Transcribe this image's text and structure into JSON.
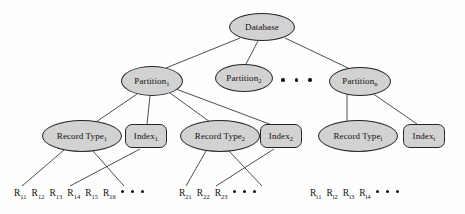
{
  "diagram": {
    "style": {
      "node_fill": "#d2d2d2",
      "node_stroke": "#262626",
      "edge_color": "#3a3a3a",
      "text_color": "#111111",
      "background": "#fefefe"
    },
    "nodes": [
      {
        "id": "database",
        "label": "Database",
        "sub": "",
        "shape": "ellipse",
        "level": 0,
        "cx": 262,
        "cy": 27,
        "w": 66,
        "h": 28
      },
      {
        "id": "partition1",
        "label": "Partition",
        "sub": "1",
        "shape": "ellipse",
        "level": 1,
        "cx": 152,
        "cy": 81,
        "w": 62,
        "h": 30
      },
      {
        "id": "partition2",
        "label": "Partition",
        "sub": "2",
        "shape": "ellipse",
        "level": 1,
        "cx": 244,
        "cy": 78,
        "w": 58,
        "h": 28
      },
      {
        "id": "partitionN",
        "label": "Partition",
        "sub": "n",
        "shape": "ellipse",
        "level": 1,
        "cx": 360,
        "cy": 81,
        "w": 62,
        "h": 29
      },
      {
        "id": "recordtype1",
        "label": "Record Type",
        "sub": "1",
        "shape": "ellipse",
        "level": 2,
        "cx": 82,
        "cy": 136,
        "w": 80,
        "h": 32
      },
      {
        "id": "index1",
        "label": "Index",
        "sub": "1",
        "shape": "roundrect",
        "level": 2,
        "cx": 146,
        "cy": 136,
        "w": 42,
        "h": 24
      },
      {
        "id": "recordtype2",
        "label": "Record Type",
        "sub": "2",
        "shape": "ellipse",
        "level": 2,
        "cx": 220,
        "cy": 136,
        "w": 80,
        "h": 32
      },
      {
        "id": "index2",
        "label": "Index",
        "sub": "2",
        "shape": "roundrect",
        "level": 2,
        "cx": 281,
        "cy": 136,
        "w": 42,
        "h": 24
      },
      {
        "id": "recordtypeI",
        "label": "Record Type",
        "sub": "i",
        "shape": "ellipse",
        "level": 2,
        "cx": 358,
        "cy": 136,
        "w": 80,
        "h": 32
      },
      {
        "id": "indexI",
        "label": "Index",
        "sub": "i",
        "shape": "roundrect",
        "level": 2,
        "cx": 424,
        "cy": 136,
        "w": 42,
        "h": 24
      }
    ],
    "edges": [
      {
        "from": "database",
        "to": "partition1",
        "x1": 240,
        "y1": 38,
        "x2": 166,
        "y2": 68
      },
      {
        "from": "database",
        "to": "partition2",
        "x1": 258,
        "y1": 41,
        "x2": 246,
        "y2": 64
      },
      {
        "from": "database",
        "to": "partitionN",
        "x1": 285,
        "y1": 38,
        "x2": 348,
        "y2": 68
      },
      {
        "from": "partition1",
        "to": "recordtype1",
        "x1": 137,
        "y1": 94,
        "x2": 96,
        "y2": 122
      },
      {
        "from": "partition1",
        "to": "index1",
        "x1": 150,
        "y1": 96,
        "x2": 147,
        "y2": 124
      },
      {
        "from": "partition1",
        "to": "recordtype2",
        "x1": 170,
        "y1": 93,
        "x2": 210,
        "y2": 122
      },
      {
        "from": "partition1",
        "to": "index2",
        "x1": 176,
        "y1": 89,
        "x2": 272,
        "y2": 125
      },
      {
        "from": "partitionN",
        "to": "recordtypeI",
        "x1": 347,
        "y1": 93,
        "x2": 347,
        "y2": 122
      },
      {
        "from": "partitionN",
        "to": "indexI",
        "x1": 372,
        "y1": 93,
        "x2": 417,
        "y2": 124
      },
      {
        "from": "recordtype1",
        "to": "R11",
        "x1": 64,
        "y1": 150,
        "x2": 22,
        "y2": 186
      },
      {
        "from": "recordtype1",
        "to": "R14",
        "x1": 92,
        "y1": 150,
        "x2": 124,
        "y2": 186
      },
      {
        "from": "index1",
        "to": "R13",
        "x1": 140,
        "y1": 149,
        "x2": 70,
        "y2": 186
      },
      {
        "from": "recordtype2",
        "to": "R21",
        "x1": 206,
        "y1": 151,
        "x2": 186,
        "y2": 186
      },
      {
        "from": "recordtype2",
        "to": "R23",
        "x1": 229,
        "y1": 151,
        "x2": 262,
        "y2": 186
      },
      {
        "from": "index2",
        "to": "R22",
        "x1": 274,
        "y1": 149,
        "x2": 216,
        "y2": 186
      }
    ],
    "mid_dots": {
      "label": "ellipsis-between-partitions",
      "count": 3,
      "x": 281,
      "y": 78
    },
    "leaf_rows": [
      {
        "id": "leaf-row-1",
        "x": 14,
        "y": 188,
        "items": [
          {
            "base": "R",
            "sub": "11"
          },
          {
            "base": "R",
            "sub": "12"
          },
          {
            "base": "R",
            "sub": "13"
          },
          {
            "base": "R",
            "sub": "14"
          },
          {
            "base": "R",
            "sub": "15"
          },
          {
            "base": "R",
            "sub": "16"
          }
        ],
        "trailing_dots": 3
      },
      {
        "id": "leaf-row-2",
        "x": 179,
        "y": 188,
        "items": [
          {
            "base": "R",
            "sub": "21"
          },
          {
            "base": "R",
            "sub": "22"
          },
          {
            "base": "R",
            "sub": "23"
          }
        ],
        "trailing_dots": 3
      },
      {
        "id": "leaf-row-3",
        "x": 310,
        "y": 188,
        "items": [
          {
            "base": "R",
            "sub": "i1"
          },
          {
            "base": "R",
            "sub": "i2"
          },
          {
            "base": "R",
            "sub": "i3"
          },
          {
            "base": "R",
            "sub": "i4"
          }
        ],
        "trailing_dots": 3
      }
    ]
  }
}
